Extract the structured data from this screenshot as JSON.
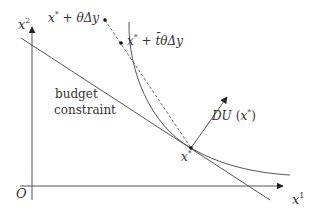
{
  "diagram": {
    "type": "economics-utility-maximization",
    "colors": {
      "line": "#555555",
      "text": "#333333",
      "background": "#ffffff"
    },
    "axes": {
      "origin_label": "O",
      "x_label_base": "x",
      "x_label_sup": "1",
      "y_label_base": "x",
      "y_label_sup": "2"
    },
    "labels": {
      "budget_line1": "budget",
      "budget_line2": "constraint",
      "gradient_base": "DU",
      "gradient_arg": "(x*)",
      "optimum_base": "x",
      "optimum_sup": "*",
      "point_theta": "x* + θΔy",
      "point_tbar": "x* + t̄θΔy"
    },
    "elements": [
      {
        "name": "y-axis",
        "kind": "arrow"
      },
      {
        "name": "x-axis",
        "kind": "arrow"
      },
      {
        "name": "budget-constraint",
        "kind": "line"
      },
      {
        "name": "indifference-curve",
        "kind": "curve"
      },
      {
        "name": "direction-segment",
        "kind": "dashed-line"
      },
      {
        "name": "gradient-vector",
        "kind": "arrow",
        "label": "DU (x*)"
      },
      {
        "name": "optimum-point",
        "kind": "point",
        "label": "x*"
      },
      {
        "name": "perturbed-point",
        "kind": "point",
        "label": "x* + θΔy"
      },
      {
        "name": "intersection-point",
        "kind": "point",
        "label": "x* + t̄θΔy"
      }
    ]
  }
}
